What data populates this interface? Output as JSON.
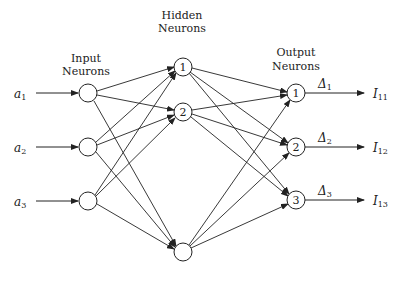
{
  "diagram": {
    "type": "neural-network",
    "layers": {
      "input": {
        "title_line1": "Input",
        "title_line2": "Neurons",
        "count": 3
      },
      "hidden": {
        "title_line1": "Hidden",
        "title_line2": "Neurons",
        "labels": [
          "1",
          "2",
          ""
        ]
      },
      "output": {
        "title_line1": "Output",
        "title_line2": "Neurons",
        "labels": [
          "1",
          "2",
          "3"
        ]
      }
    },
    "inputs": [
      {
        "symbol": "a",
        "sub": "1"
      },
      {
        "symbol": "a",
        "sub": "2"
      },
      {
        "symbol": "a",
        "sub": "3"
      }
    ],
    "deltas": [
      {
        "symbol": "Δ",
        "sub": "1"
      },
      {
        "symbol": "Δ",
        "sub": "2"
      },
      {
        "symbol": "Δ",
        "sub": "3"
      }
    ],
    "outputs": [
      {
        "symbol": "I",
        "sub": "11"
      },
      {
        "symbol": "I",
        "sub": "12"
      },
      {
        "symbol": "I",
        "sub": "13"
      }
    ],
    "colors": {
      "stroke": "#222222",
      "background": "#ffffff"
    }
  }
}
